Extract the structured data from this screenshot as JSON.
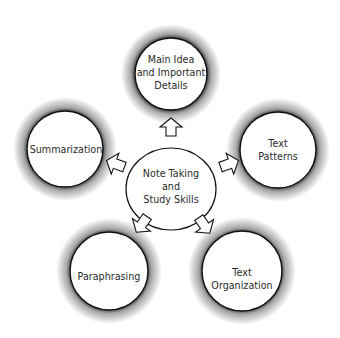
{
  "diagram": {
    "type": "hub-and-spoke",
    "center": {
      "id": "center",
      "lines": [
        "Note Taking",
        "and",
        "Study Skills"
      ]
    },
    "nodes": [
      {
        "id": "main-idea",
        "lines": [
          "Main Idea",
          "and Important",
          "Details"
        ]
      },
      {
        "id": "text-patterns",
        "lines": [
          "Text",
          "Patterns"
        ]
      },
      {
        "id": "text-organization",
        "lines": [
          "Text",
          "Organization"
        ]
      },
      {
        "id": "paraphrasing",
        "lines": [
          "Paraphrasing"
        ]
      },
      {
        "id": "summarization",
        "lines": [
          "Summarization"
        ]
      }
    ],
    "edges": [
      {
        "from": "center",
        "to": "main-idea",
        "style": "block-arrow-outline"
      },
      {
        "from": "center",
        "to": "text-patterns",
        "style": "block-arrow-outline"
      },
      {
        "from": "center",
        "to": "text-organization",
        "style": "block-arrow-outline"
      },
      {
        "from": "center",
        "to": "paraphrasing",
        "style": "block-arrow-outline"
      },
      {
        "from": "center",
        "to": "summarization",
        "style": "block-arrow-outline"
      }
    ],
    "colors": {
      "background": "#ffffff",
      "circle_fill": "#ffffff",
      "circle_stroke": "#111111",
      "shadow": "#000000",
      "text": "#2a2a2a"
    }
  }
}
